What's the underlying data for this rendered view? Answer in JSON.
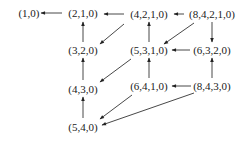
{
  "diagram": {
    "type": "directed-graph",
    "nodes": [
      {
        "id": "n10",
        "label": "(1,0)",
        "x": 29,
        "y": 13
      },
      {
        "id": "n210",
        "label": "(2,1,0)",
        "x": 83,
        "y": 13
      },
      {
        "id": "n4210",
        "label": "(4,2,1,0)",
        "x": 149,
        "y": 14
      },
      {
        "id": "n84210",
        "label": "(8,4,2,1,0)",
        "x": 212,
        "y": 14
      },
      {
        "id": "n320",
        "label": "(3,2,0)",
        "x": 83,
        "y": 50
      },
      {
        "id": "n5310",
        "label": "(5,3,1,0)",
        "x": 149,
        "y": 50
      },
      {
        "id": "n6320",
        "label": "(6,3,2,0)",
        "x": 212,
        "y": 50
      },
      {
        "id": "n430",
        "label": "(4,3,0)",
        "x": 83,
        "y": 89
      },
      {
        "id": "n6410",
        "label": "(6,4,1,0)",
        "x": 149,
        "y": 86
      },
      {
        "id": "n8430",
        "label": "(8,4,3,0)",
        "x": 212,
        "y": 86
      },
      {
        "id": "n540",
        "label": "(5,4,0)",
        "x": 83,
        "y": 127
      }
    ],
    "edges": [
      {
        "from": "(2,1,0)",
        "to": "(1,0)",
        "x1": 62,
        "y1": 13,
        "x2": 41,
        "y2": 13
      },
      {
        "from": "(4,2,1,0)",
        "to": "(2,1,0)",
        "x1": 124,
        "y1": 14,
        "x2": 104,
        "y2": 14
      },
      {
        "from": "(8,4,2,1,0)",
        "to": "(4,2,1,0)",
        "x1": 184,
        "y1": 14,
        "x2": 174,
        "y2": 14
      },
      {
        "from": "(3,2,0)",
        "to": "(2,1,0)",
        "x1": 83,
        "y1": 42,
        "x2": 83,
        "y2": 22
      },
      {
        "from": "(4,2,1,0)",
        "to": "(3,2,0)",
        "x1": 124,
        "y1": 24,
        "x2": 100,
        "y2": 44
      },
      {
        "from": "(5,3,1,0)",
        "to": "(4,2,1,0)",
        "x1": 149,
        "y1": 42,
        "x2": 149,
        "y2": 22
      },
      {
        "from": "(8,4,2,1,0)",
        "to": "(5,3,1,0)",
        "x1": 194,
        "y1": 23,
        "x2": 164,
        "y2": 44
      },
      {
        "from": "(8,4,2,1,0)",
        "to": "(6,3,2,0)",
        "x1": 212,
        "y1": 22,
        "x2": 212,
        "y2": 42
      },
      {
        "from": "(6,3,2,0)",
        "to": "(5,3,1,0)",
        "x1": 190,
        "y1": 50,
        "x2": 172,
        "y2": 50
      },
      {
        "from": "(4,3,0)",
        "to": "(3,2,0)",
        "x1": 83,
        "y1": 80,
        "x2": 83,
        "y2": 58
      },
      {
        "from": "(5,3,1,0)",
        "to": "(4,3,0)",
        "x1": 131,
        "y1": 59,
        "x2": 100,
        "y2": 82
      },
      {
        "from": "(6,4,1,0)",
        "to": "(5,3,1,0)",
        "x1": 149,
        "y1": 78,
        "x2": 149,
        "y2": 58
      },
      {
        "from": "(8,4,3,0)",
        "to": "(6,3,2,0)",
        "x1": 212,
        "y1": 78,
        "x2": 212,
        "y2": 58
      },
      {
        "from": "(8,4,3,0)",
        "to": "(6,4,1,0)",
        "x1": 191,
        "y1": 86,
        "x2": 172,
        "y2": 86
      },
      {
        "from": "(5,4,0)",
        "to": "(4,3,0)",
        "x1": 83,
        "y1": 118,
        "x2": 83,
        "y2": 97
      },
      {
        "from": "(6,4,1,0)",
        "to": "(5,4,0)",
        "x1": 132,
        "y1": 95,
        "x2": 100,
        "y2": 119
      },
      {
        "from": "(8,4,3,0)",
        "to": "(5,4,0)",
        "x1": 194,
        "y1": 93,
        "x2": 102,
        "y2": 125
      }
    ]
  }
}
